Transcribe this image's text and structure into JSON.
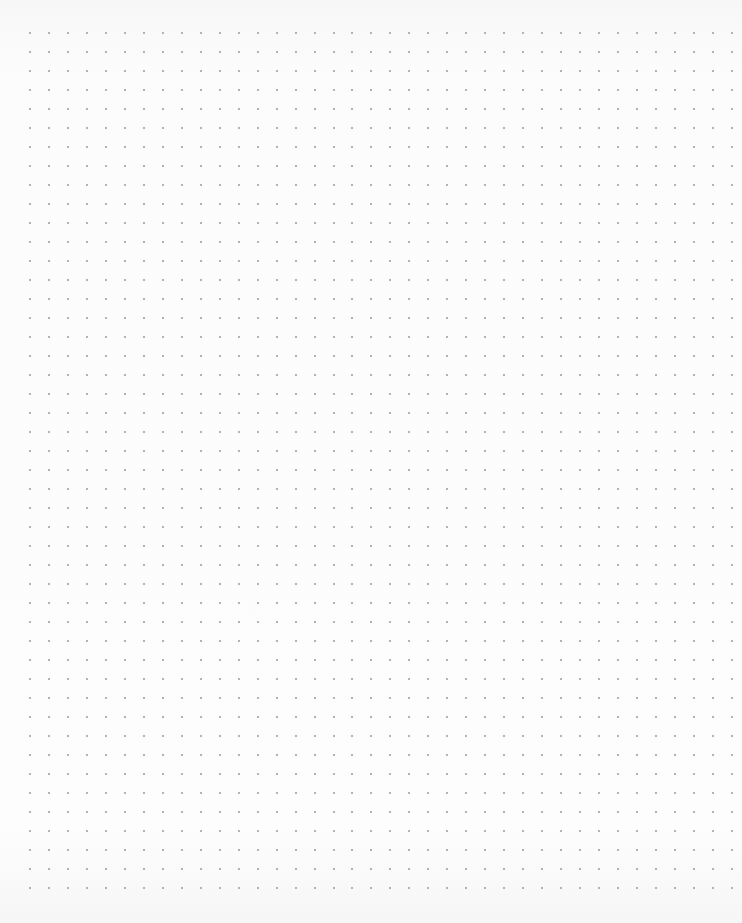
{
  "page": {
    "type": "dot-grid-paper",
    "background_color": "#fbfbfb",
    "dot_color": "#9a9a9a"
  },
  "grid": {
    "columns": 38,
    "rows": 46,
    "spacing_x": 18.97,
    "spacing_y": 19.0,
    "origin_x": 29,
    "origin_y": 32
  }
}
